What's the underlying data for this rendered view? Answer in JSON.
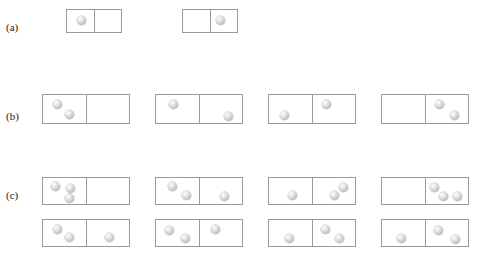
{
  "figure": {
    "type": "microstate-diagram",
    "background_color": "#ffffff",
    "box_border_color": "#9a9a9a",
    "ball_color": "#cfcfcf",
    "ball_diameter_px": 9
  },
  "rows": [
    {
      "label": "(a)",
      "label_x": 6,
      "label_y": 22,
      "particle_count": 1,
      "boxes": [
        {
          "x": 66,
          "y": 9,
          "width": 56,
          "height": 24,
          "left_count": 1,
          "right_count": 0,
          "balls": [
            {
              "x": 10,
              "y": 6,
              "side": "left"
            }
          ]
        },
        {
          "x": 182,
          "y": 9,
          "width": 56,
          "height": 24,
          "left_count": 0,
          "right_count": 1,
          "balls": [
            {
              "x": 33,
              "y": 6,
              "side": "right"
            }
          ]
        }
      ]
    },
    {
      "label": "(b)",
      "label_x": 6,
      "label_y": 111,
      "particle_count": 2,
      "boxes": [
        {
          "x": 42,
          "y": 94,
          "width": 88,
          "height": 30,
          "left_count": 2,
          "right_count": 0,
          "balls": [
            {
              "x": 10,
              "y": 5,
              "side": "left"
            },
            {
              "x": 22,
              "y": 15,
              "side": "left"
            }
          ]
        },
        {
          "x": 155,
          "y": 94,
          "width": 88,
          "height": 30,
          "left_count": 1,
          "right_count": 1,
          "balls": [
            {
              "x": 13,
              "y": 5,
              "side": "left"
            },
            {
              "x": 68,
              "y": 17,
              "side": "right"
            }
          ]
        },
        {
          "x": 268,
          "y": 94,
          "width": 88,
          "height": 30,
          "left_count": 1,
          "right_count": 1,
          "balls": [
            {
              "x": 11,
              "y": 16,
              "side": "left"
            },
            {
              "x": 53,
              "y": 5,
              "side": "right"
            }
          ]
        },
        {
          "x": 381,
          "y": 94,
          "width": 88,
          "height": 30,
          "left_count": 0,
          "right_count": 2,
          "balls": [
            {
              "x": 53,
              "y": 5,
              "side": "right"
            },
            {
              "x": 68,
              "y": 16,
              "side": "right"
            }
          ]
        }
      ]
    },
    {
      "label": "(c)",
      "label_x": 6,
      "label_y": 190,
      "particle_count": 3,
      "boxes": [
        {
          "x": 42,
          "y": 177,
          "width": 88,
          "height": 28,
          "left_count": 3,
          "right_count": 0,
          "balls": [
            {
              "x": 8,
              "y": 4,
              "side": "left"
            },
            {
              "x": 23,
              "y": 6,
              "side": "left"
            },
            {
              "x": 22,
              "y": 16,
              "side": "left"
            }
          ]
        },
        {
          "x": 155,
          "y": 177,
          "width": 88,
          "height": 28,
          "left_count": 2,
          "right_count": 1,
          "balls": [
            {
              "x": 12,
              "y": 4,
              "side": "left"
            },
            {
              "x": 26,
              "y": 13,
              "side": "left"
            },
            {
              "x": 64,
              "y": 14,
              "side": "right"
            }
          ]
        },
        {
          "x": 268,
          "y": 177,
          "width": 88,
          "height": 28,
          "left_count": 1,
          "right_count": 2,
          "balls": [
            {
              "x": 19,
              "y": 13,
              "side": "left"
            },
            {
              "x": 61,
              "y": 13,
              "side": "right"
            },
            {
              "x": 70,
              "y": 5,
              "side": "right"
            }
          ]
        },
        {
          "x": 381,
          "y": 177,
          "width": 88,
          "height": 28,
          "left_count": 0,
          "right_count": 3,
          "balls": [
            {
              "x": 48,
              "y": 5,
              "side": "right"
            },
            {
              "x": 57,
              "y": 14,
              "side": "right"
            },
            {
              "x": 71,
              "y": 14,
              "side": "right"
            }
          ]
        },
        {
          "x": 42,
          "y": 219,
          "width": 88,
          "height": 28,
          "left_count": 2,
          "right_count": 1,
          "balls": [
            {
              "x": 10,
              "y": 5,
              "side": "left"
            },
            {
              "x": 22,
              "y": 13,
              "side": "left"
            },
            {
              "x": 62,
              "y": 13,
              "side": "right"
            }
          ]
        },
        {
          "x": 155,
          "y": 219,
          "width": 88,
          "height": 28,
          "left_count": 2,
          "right_count": 1,
          "balls": [
            {
              "x": 9,
              "y": 6,
              "side": "left"
            },
            {
              "x": 25,
              "y": 14,
              "side": "left"
            },
            {
              "x": 55,
              "y": 5,
              "side": "right"
            }
          ]
        },
        {
          "x": 268,
          "y": 219,
          "width": 88,
          "height": 28,
          "left_count": 1,
          "right_count": 2,
          "balls": [
            {
              "x": 16,
              "y": 14,
              "side": "left"
            },
            {
              "x": 52,
              "y": 5,
              "side": "right"
            },
            {
              "x": 66,
              "y": 14,
              "side": "right"
            }
          ]
        },
        {
          "x": 381,
          "y": 219,
          "width": 88,
          "height": 28,
          "left_count": 1,
          "right_count": 2,
          "balls": [
            {
              "x": 15,
              "y": 14,
              "side": "left"
            },
            {
              "x": 52,
              "y": 6,
              "side": "right"
            },
            {
              "x": 69,
              "y": 15,
              "side": "right"
            }
          ]
        }
      ]
    }
  ]
}
